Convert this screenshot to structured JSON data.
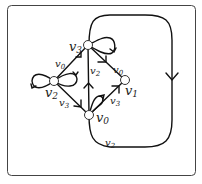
{
  "diagram": {
    "type": "directed-graph",
    "frame": {
      "stroke": "#444444",
      "radius": 4
    },
    "edge_color": "#111111",
    "nodes": [
      {
        "id": "v0",
        "label": "v",
        "sub": "0",
        "x": 89,
        "y": 115
      },
      {
        "id": "v1",
        "label": "v",
        "sub": "1",
        "x": 125,
        "y": 80
      },
      {
        "id": "v2",
        "label": "v",
        "sub": "2",
        "x": 54,
        "y": 81
      },
      {
        "id": "v3",
        "label": "v",
        "sub": "3",
        "x": 88,
        "y": 45
      }
    ],
    "edges": [
      {
        "from": "v2",
        "to": "v3",
        "label": "v0"
      },
      {
        "from": "v2",
        "to": "v0",
        "label": "v3"
      },
      {
        "from": "v0",
        "to": "v3",
        "label": "v2"
      },
      {
        "from": "v3",
        "to": "v1",
        "label": "v0"
      },
      {
        "from": "v0",
        "to": "v1",
        "label": "v3"
      },
      {
        "from": "v0",
        "to": "v3",
        "label": "v2",
        "route": "outer-loop"
      },
      {
        "from": "v2",
        "to": "v2",
        "label": "",
        "type": "self-loop-left"
      },
      {
        "from": "v2",
        "to": "v2",
        "label": "",
        "type": "self-loop-right"
      },
      {
        "from": "v3",
        "to": "v3",
        "label": "",
        "type": "self-loop"
      },
      {
        "from": "v0",
        "to": "v0",
        "label": "",
        "type": "self-loop"
      }
    ],
    "labels": {
      "n_v3": "v",
      "n_v3_sub": "3",
      "n_v2": "v",
      "n_v2_sub": "2",
      "n_v1": "v",
      "n_v1_sub": "1",
      "n_v0": "v",
      "n_v0_sub": "0",
      "e_v2v3": "v",
      "e_v2v3_sub": "0",
      "e_v2v0": "v",
      "e_v2v0_sub": "3",
      "e_v0v3": "v",
      "e_v0v3_sub": "2",
      "e_v3v1": "v",
      "e_v3v1_sub": "0",
      "e_v0v1": "v",
      "e_v0v1_sub": "3",
      "e_outer": "v",
      "e_outer_sub": "2"
    }
  }
}
